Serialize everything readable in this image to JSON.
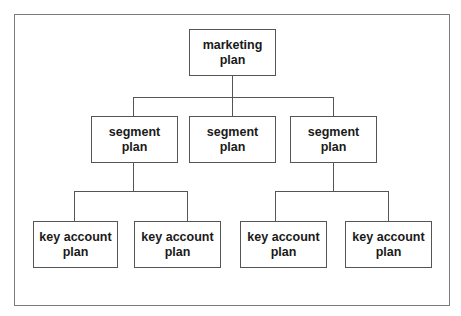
{
  "diagram": {
    "type": "org-chart",
    "root": {
      "line1": "marketing",
      "line2": "plan"
    },
    "segments": [
      {
        "line1": "segment",
        "line2": "plan"
      },
      {
        "line1": "segment",
        "line2": "plan"
      },
      {
        "line1": "segment",
        "line2": "plan"
      }
    ],
    "key_accounts": [
      {
        "line1": "key account",
        "line2": "plan",
        "parent": 0
      },
      {
        "line1": "key account",
        "line2": "plan",
        "parent": 0
      },
      {
        "line1": "key account",
        "line2": "plan",
        "parent": 2
      },
      {
        "line1": "key account",
        "line2": "plan",
        "parent": 2
      }
    ]
  }
}
